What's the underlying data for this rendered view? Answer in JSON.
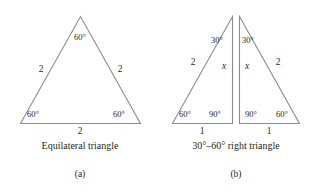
{
  "figure": {
    "stroke_color": "#8c8c8c",
    "text_color": "#1f1f1f",
    "background": "#ffffff",
    "panels": [
      {
        "id": "a",
        "panel_label": "(a)",
        "caption": "Equilateral triangle",
        "angles": [
          "60°",
          "60°",
          "60°"
        ],
        "sides": [
          "2",
          "2",
          "2"
        ],
        "labels": {
          "apex_angle": "60°",
          "left_angle": "60°",
          "right_angle": "60°",
          "left_side": "2",
          "right_side": "2",
          "base_side": "2"
        }
      },
      {
        "id": "b",
        "panel_label": "(b)",
        "caption": "30°–60° right triangle",
        "left_triangle": {
          "apex_angle": "30°",
          "base_left_angle": "60°",
          "base_right_angle": "90°",
          "hypotenuse": "2",
          "vertical_side": "x",
          "base_side": "1"
        },
        "right_triangle": {
          "apex_angle": "30°",
          "base_left_angle": "90°",
          "base_right_angle": "60°",
          "hypotenuse": "2",
          "vertical_side": "x",
          "base_side": "1"
        }
      }
    ]
  }
}
